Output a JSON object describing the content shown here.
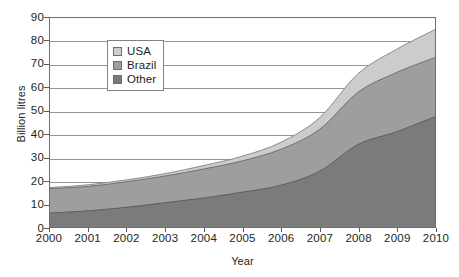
{
  "chart_data": {
    "type": "area",
    "stacked": true,
    "title": "",
    "xlabel": "Year",
    "ylabel": "Billion litres",
    "x": [
      2000,
      2001,
      2002,
      2003,
      2004,
      2005,
      2006,
      2007,
      2008,
      2009,
      2010
    ],
    "categories": [
      "2000",
      "2001",
      "2002",
      "2003",
      "2004",
      "2005",
      "2006",
      "2007",
      "2008",
      "2009",
      "2010"
    ],
    "series": [
      {
        "name": "Other",
        "color": "#7b7b7b",
        "values": [
          6,
          7,
          8.5,
          10.5,
          12.5,
          15,
          18,
          24,
          35.5,
          41,
          47.5
        ]
      },
      {
        "name": "Brazil",
        "color": "#9e9e9e",
        "values": [
          10.5,
          10.5,
          11,
          11.5,
          12.5,
          13.5,
          15.5,
          18,
          22.5,
          25.5,
          25.5
        ]
      },
      {
        "name": "USA",
        "color": "#cccccc",
        "values": [
          0.5,
          0.7,
          0.8,
          1.0,
          1.5,
          2.0,
          3.0,
          5.0,
          8.0,
          10.0,
          12.0
        ]
      }
    ],
    "stack_tops": {
      "other": [
        6,
        7,
        8.5,
        10.5,
        12.5,
        15,
        18,
        24,
        35.5,
        41,
        47.5
      ],
      "brazil": [
        16.5,
        17.5,
        19.5,
        22,
        25,
        28.5,
        33.5,
        42,
        58,
        66.5,
        73
      ],
      "total": [
        17,
        18.2,
        20.3,
        23,
        26.5,
        30.5,
        36.5,
        47,
        66,
        76.5,
        85
      ]
    },
    "ylim": [
      0,
      90
    ],
    "ytick_step": 10,
    "yticks": [
      "90",
      "80",
      "70",
      "60",
      "50",
      "40",
      "30",
      "20",
      "10",
      "0"
    ],
    "xlim": [
      2000,
      2010
    ],
    "grid": "horizontal",
    "legend_position": "top-left",
    "legend": [
      {
        "label": "USA",
        "color": "#cccccc"
      },
      {
        "label": "Brazil",
        "color": "#9e9e9e"
      },
      {
        "label": "Other",
        "color": "#7b7b7b"
      }
    ],
    "colors": {
      "usa": "#cccccc",
      "brazil": "#9e9e9e",
      "other": "#7b7b7b",
      "gridline": "#939598",
      "frame": "#6d6e71",
      "text": "#231f20",
      "background": "#ffffff"
    }
  }
}
